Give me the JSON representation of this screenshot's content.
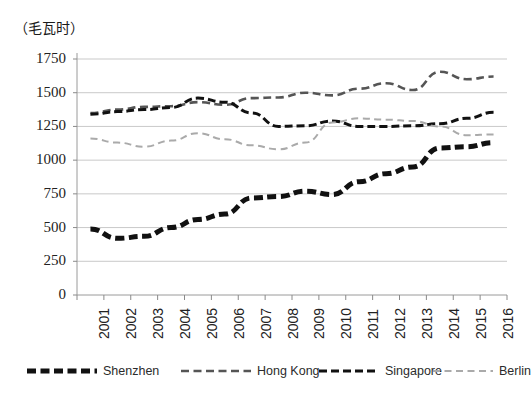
{
  "chart_data": {
    "type": "line",
    "title": "（毛瓦时）",
    "xlabel": "",
    "ylabel": "（毛瓦时）",
    "grid": true,
    "legend_position": "bottom",
    "ylim": [
      0,
      1750
    ],
    "yticks": [
      0,
      250,
      500,
      750,
      1000,
      1250,
      1500,
      1750
    ],
    "categories": [
      "2001",
      "2002",
      "2003",
      "2004",
      "2005",
      "2006",
      "2007",
      "2008",
      "2009",
      "2010",
      "2011",
      "2012",
      "2013",
      "2014",
      "2015",
      "2016"
    ],
    "series": [
      {
        "name": "Shenzhen",
        "color": "#111111",
        "style": "thick-dashed",
        "values": [
          490,
          420,
          435,
          500,
          560,
          600,
          720,
          730,
          770,
          745,
          840,
          900,
          950,
          1090,
          1100,
          1130
        ]
      },
      {
        "name": "Hong Kong",
        "color": "#555555",
        "style": "medium-dashed",
        "values": [
          1350,
          1375,
          1395,
          1400,
          1430,
          1410,
          1460,
          1465,
          1500,
          1480,
          1530,
          1570,
          1520,
          1655,
          1600,
          1620
        ]
      },
      {
        "name": "Singapore",
        "color": "#111111",
        "style": "thin-dashed",
        "values": [
          1340,
          1360,
          1375,
          1390,
          1460,
          1430,
          1350,
          1250,
          1255,
          1290,
          1250,
          1250,
          1255,
          1270,
          1310,
          1355
        ]
      },
      {
        "name": "Berlin",
        "color": "#aaaaaa",
        "style": "light-dashed",
        "values": [
          1160,
          1130,
          1100,
          1145,
          1200,
          1155,
          1110,
          1080,
          1130,
          1280,
          1310,
          1300,
          1290,
          1250,
          1185,
          1190
        ]
      }
    ]
  },
  "legend": {
    "items": [
      {
        "label": "Shenzhen"
      },
      {
        "label": "Hong Kong"
      },
      {
        "label": "Singapore"
      },
      {
        "label": "Berlin"
      }
    ]
  }
}
